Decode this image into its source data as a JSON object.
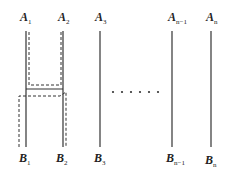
{
  "diagram": {
    "top_labels": [
      {
        "base": "A",
        "sub": "1"
      },
      {
        "base": "A",
        "sub": "2"
      },
      {
        "base": "A",
        "sub": "3"
      },
      {
        "base": "A",
        "sub": "n−1"
      },
      {
        "base": "A",
        "sub": "n"
      }
    ],
    "bottom_labels": [
      {
        "base": "B",
        "sub": "1"
      },
      {
        "base": "B",
        "sub": "2"
      },
      {
        "base": "B",
        "sub": "3"
      },
      {
        "base": "B",
        "sub": "n−1"
      },
      {
        "base": "B",
        "sub": "n"
      }
    ],
    "ellipsis_dot_count": 6,
    "line_color": "#333333"
  }
}
